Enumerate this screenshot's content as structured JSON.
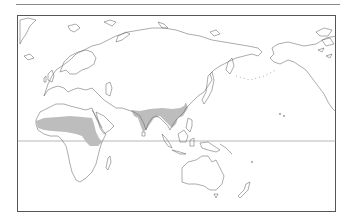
{
  "map": {
    "type": "distribution-range-map",
    "projection": "world-outline-africa-eurasia-australia-pacific",
    "colors": {
      "background": "#ffffff",
      "coastline": "#666666",
      "range_fill": "#bdbdbd",
      "frame": "#555555",
      "equator": "#888888"
    },
    "ranges": [
      {
        "region": "Sahel belt, Africa"
      },
      {
        "region": "Indian subcontinent"
      },
      {
        "region": "Southeast Asia / Indochina"
      }
    ],
    "features": [
      "top-rule",
      "map-frame",
      "equator-line"
    ]
  }
}
